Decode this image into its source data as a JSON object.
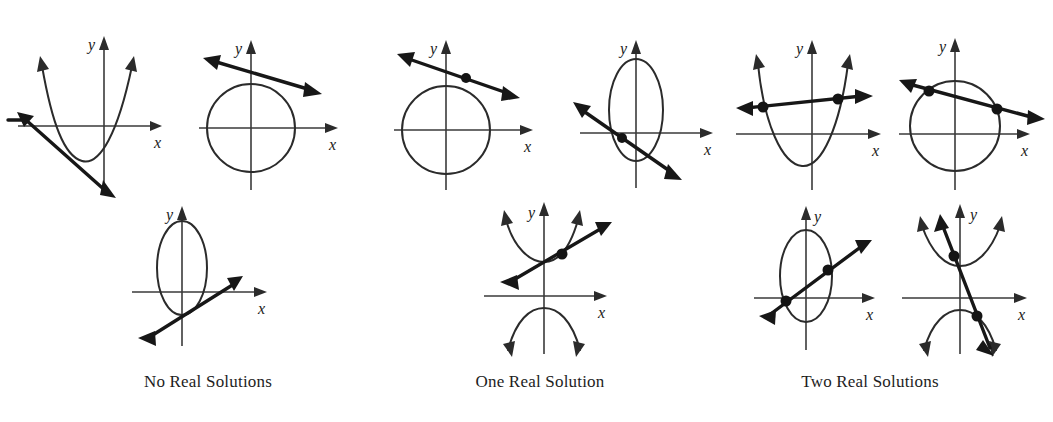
{
  "figure": {
    "background_color": "#ffffff",
    "curve_color": "#2b2b2b",
    "line_color": "#171717",
    "axis_color": "#3a3a3a",
    "dot_color": "#141414"
  },
  "axis_labels": {
    "x": "x",
    "y": "y"
  },
  "groups": [
    {
      "id": "no-real-solutions",
      "caption": "No Real Solutions",
      "intersection_count": 0,
      "panels": [
        {
          "id": "parabola-missed-line",
          "conic": "parabola",
          "orientation": "opens-up",
          "line": "secant-missing",
          "intersections": 0,
          "description": "Upward parabola with a line passing below and left of the vertex, never touching."
        },
        {
          "id": "circle-missed-line",
          "conic": "circle",
          "orientation": "centered",
          "line": "line-above",
          "intersections": 0,
          "description": "Circle with a shallow line passing just above the top of the circle."
        },
        {
          "id": "ellipse-missed-line",
          "conic": "ellipse",
          "orientation": "vertical-major",
          "line": "line-below-right",
          "intersections": 0,
          "description": "Vertical ellipse with a rising line passing below and to the right of it."
        }
      ]
    },
    {
      "id": "one-real-solution",
      "caption": "One Real Solution",
      "intersection_count": 1,
      "panels": [
        {
          "id": "circle-tangent",
          "conic": "circle",
          "orientation": "centered",
          "line": "tangent",
          "intersections": 1,
          "description": "Circle with a line tangent at the upper-right of the circle."
        },
        {
          "id": "ellipse-tangent",
          "conic": "ellipse",
          "orientation": "vertical-major",
          "line": "tangent",
          "intersections": 1,
          "description": "Vertical ellipse with a line tangent at the lower-left of the ellipse."
        },
        {
          "id": "hyperbola-tangent",
          "conic": "hyperbola",
          "orientation": "vertical-transverse",
          "line": "tangent",
          "intersections": 1,
          "description": "Vertical hyperbola with a line tangent to the upper branch at one point."
        }
      ]
    },
    {
      "id": "two-real-solutions",
      "caption": "Two Real Solutions",
      "intersection_count": 2,
      "panels": [
        {
          "id": "parabola-secant",
          "conic": "parabola",
          "orientation": "opens-up",
          "line": "secant",
          "intersections": 2,
          "description": "Upward parabola crossed by a nearly horizontal line at two points."
        },
        {
          "id": "circle-secant",
          "conic": "circle",
          "orientation": "centered",
          "line": "secant",
          "intersections": 2,
          "description": "Circle crossed by a descending line at two points."
        },
        {
          "id": "ellipse-secant",
          "conic": "ellipse",
          "orientation": "vertical-major",
          "line": "secant",
          "intersections": 2,
          "description": "Vertical ellipse crossed by a rising line at two points."
        },
        {
          "id": "hyperbola-secant",
          "conic": "hyperbola",
          "orientation": "vertical-transverse",
          "line": "secant",
          "intersections": 2,
          "description": "Vertical hyperbola crossed by a steep line hitting both branches."
        }
      ]
    }
  ]
}
